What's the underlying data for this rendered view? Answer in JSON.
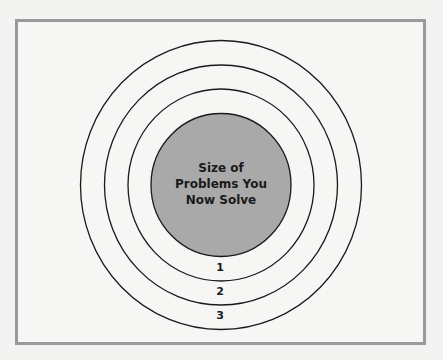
{
  "diagram": {
    "center": {
      "lines": [
        "Size of",
        "Problems You",
        "Now Solve"
      ],
      "fill": "#a9a9a9"
    },
    "rings": [
      {
        "label": "1"
      },
      {
        "label": "2"
      },
      {
        "label": "3"
      }
    ],
    "colors": {
      "frame_border": "#9a9a9a",
      "ring_stroke": "#1a1a1a",
      "background": "#f6f6f5"
    }
  }
}
